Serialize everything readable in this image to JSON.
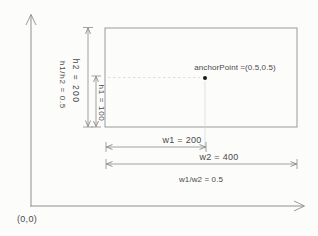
{
  "figure": {
    "origin_label": "(0,0)",
    "anchor_label": "anchorPoint =(0.5,0.5)",
    "dimensions": {
      "h1_label": "h1 = 100",
      "h2_label": "h2 = 200",
      "h_ratio_label": "h1/h2 = 0.5",
      "w1_label": "w1 = 200",
      "w2_label": "w2 = 400",
      "w_ratio_label": "w1/w2 = 0.5"
    },
    "colors": {
      "axis_line": "#8f8f8f",
      "dimension_line": "#8a8a8a",
      "rectangle_border": "#9a9a9a",
      "label_text": "#4a4a4a",
      "anchor_dot": "#1a1a1a",
      "guide_line": "#d5d5d3",
      "background": "#fcfcfa"
    }
  }
}
